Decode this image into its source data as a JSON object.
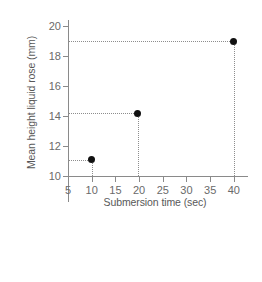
{
  "chart_data": {
    "type": "scatter",
    "title": "",
    "xlabel": "Submersion time (sec)",
    "ylabel": "Mean height liquid rose (mm)",
    "xlim": [
      5,
      41.5
    ],
    "ylim": [
      10,
      20
    ],
    "xticks": [
      5,
      10,
      15,
      20,
      25,
      30,
      35,
      40
    ],
    "yticks": [
      10,
      12,
      14,
      16,
      18,
      20
    ],
    "xticklabels": [
      "5",
      "10",
      "15",
      "20",
      "25",
      "30",
      "35",
      "40"
    ],
    "yticklabels": [
      "10",
      "12",
      "14",
      "16",
      "18",
      "20"
    ],
    "grid": false,
    "legend": false,
    "marker": "filled-circle",
    "marker_color": "#111111",
    "axis_color": "#8a8a8a",
    "guide_color": "#8d8d8d",
    "guide_style": "dotted",
    "x": [
      10,
      19.7,
      40
    ],
    "y": [
      11.1,
      14.2,
      19.0
    ],
    "points": [
      {
        "x": 10,
        "y": 11.1
      },
      {
        "x": 19.7,
        "y": 14.2
      },
      {
        "x": 40,
        "y": 19.0
      }
    ]
  }
}
